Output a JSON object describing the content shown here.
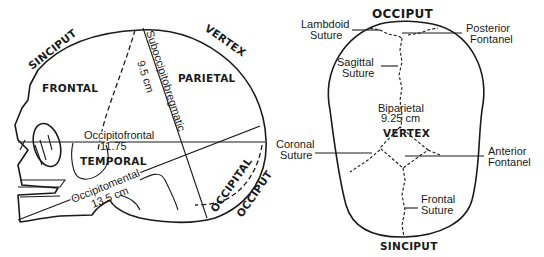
{
  "lateral_view": {
    "regions": {
      "sinciput": "SINCIPUT",
      "vertex": "VERTEX",
      "frontal": "FRONTAL",
      "parietal": "PARIETAL",
      "temporal": "TEMPORAL",
      "occipital": "OCCIPITAL",
      "occiput": "OCCIPUT"
    },
    "diameters": {
      "suboccipitobregmatic_name": "Suboccipitobregmatic",
      "suboccipitobregmatic_value": "9.5 cm",
      "occipitofrontal_name": "Occipitofrontal",
      "occipitofrontal_value": "11.75",
      "occipitomental_name": "Occipitomental",
      "occipitomental_value": "13.5 cm"
    }
  },
  "superior_view": {
    "regions": {
      "occiput": "OCCIPUT",
      "vertex": "VERTEX",
      "sinciput": "SINCIPUT"
    },
    "labels": {
      "lambdoid_1": "Lambdoid",
      "lambdoid_2": "Suture",
      "posterior_1": "Posterior",
      "posterior_2": "Fontanel",
      "sagittal_1": "Sagittal",
      "sagittal_2": "Suture",
      "biparietal_1": "Biparietal",
      "biparietal_2": "9.25 cm",
      "coronal_1": "Coronal",
      "coronal_2": "Suture",
      "anterior_1": "Anterior",
      "anterior_2": "Fontanel",
      "frontal_1": "Frontal",
      "frontal_2": "Suture"
    }
  }
}
